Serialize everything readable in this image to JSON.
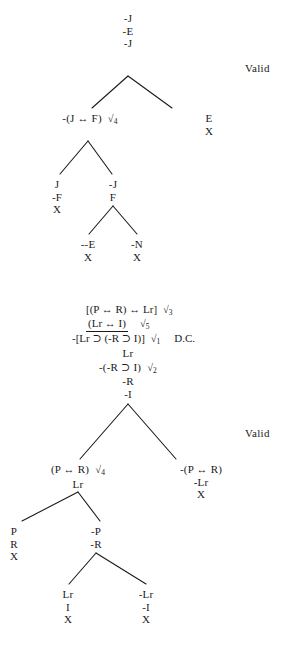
{
  "document": {
    "type": "logic-truth-tree-proofs",
    "verdicts": [
      {
        "label": "Valid",
        "x": 245,
        "y": 62
      },
      {
        "label": "Valid",
        "x": 245,
        "y": 427
      }
    ]
  },
  "proof_one": {
    "trunk": {
      "lines": [
        "-J",
        "-E",
        "-J"
      ],
      "x": 128,
      "y": 12
    },
    "left_branch": {
      "lines": [
        "-(J ↔ F)",
        "√4"
      ],
      "text": "-(J ↔ F)",
      "check": "√",
      "check_sub": "4",
      "x": 90,
      "y": 112
    },
    "right_branch": {
      "lines": [
        "E",
        "X"
      ],
      "x": 209,
      "y": 112
    },
    "left_left": {
      "lines": [
        "J",
        "-F",
        "X"
      ],
      "x": 57,
      "y": 178
    },
    "left_right": {
      "lines": [
        "-J",
        "F"
      ],
      "x": 113,
      "y": 178
    },
    "leaf_a": {
      "lines": [
        "--E",
        "X"
      ],
      "x": 88,
      "y": 238
    },
    "leaf_b": {
      "lines": [
        "-N",
        "X"
      ],
      "x": 137,
      "y": 238
    }
  },
  "proof_two": {
    "premises": [
      {
        "text": "[(P ↔ R) ↔ Lr]",
        "check": "√",
        "check_sub": "3",
        "underline": false,
        "note": ""
      },
      {
        "text": "(Lr ↔ I)",
        "check": "√",
        "check_sub": "5",
        "underline": true,
        "note": ""
      },
      {
        "text": "-[Lr ⊃ (-R ⊃ I)]",
        "check": "√",
        "check_sub": "1",
        "underline": false,
        "note": "D.C."
      }
    ],
    "trunk": {
      "lines": [
        "Lr"
      ],
      "x": 128,
      "y": 349
    },
    "decomposed": {
      "text": "-(-R ⊃ I)",
      "check": "√",
      "check_sub": "2",
      "x": 128,
      "y": 362
    },
    "trunk_tail": {
      "lines": [
        "-R",
        "-I"
      ],
      "x": 128,
      "y": 376
    },
    "left_branch": {
      "text": "(P ↔ R)",
      "check": "√",
      "check_sub": "4",
      "sub_line": "Lr",
      "x": 78,
      "y": 463
    },
    "right_branch": {
      "lines": [
        "-(P ↔ R)",
        "-Lr",
        "X"
      ],
      "x": 201,
      "y": 463
    },
    "left_left": {
      "lines": [
        "P",
        "R",
        "X"
      ],
      "x": 14,
      "y": 525
    },
    "left_right": {
      "lines": [
        "-P",
        "-R"
      ],
      "x": 96,
      "y": 525
    },
    "leaf_a": {
      "lines": [
        "Lr",
        "I",
        "X"
      ],
      "x": 68,
      "y": 588
    },
    "leaf_b": {
      "lines": [
        "-Lr",
        "-I",
        "X"
      ],
      "x": 146,
      "y": 588
    }
  },
  "connectors": {
    "proof_one": [
      {
        "name": "root-split-left",
        "x1": 128,
        "y1": 76,
        "x2": 92,
        "y2": 108
      },
      {
        "name": "root-split-right",
        "x1": 128,
        "y1": 76,
        "x2": 172,
        "y2": 108
      },
      {
        "name": "left-split-left",
        "x1": 88,
        "y1": 141,
        "x2": 60,
        "y2": 174
      },
      {
        "name": "left-split-right",
        "x1": 88,
        "y1": 141,
        "x2": 112,
        "y2": 174
      },
      {
        "name": "f-split-left",
        "x1": 113,
        "y1": 206,
        "x2": 89,
        "y2": 234
      },
      {
        "name": "f-split-right",
        "x1": 113,
        "y1": 206,
        "x2": 137,
        "y2": 234
      }
    ],
    "proof_two": [
      {
        "name": "root-split-left",
        "x1": 128,
        "y1": 404,
        "x2": 80,
        "y2": 459
      },
      {
        "name": "root-split-right",
        "x1": 128,
        "y1": 404,
        "x2": 176,
        "y2": 459
      },
      {
        "name": "left-split-left",
        "x1": 78,
        "y1": 492,
        "x2": 22,
        "y2": 521
      },
      {
        "name": "left-split-right",
        "x1": 78,
        "y1": 492,
        "x2": 100,
        "y2": 521
      },
      {
        "name": "r-split-left",
        "x1": 96,
        "y1": 553,
        "x2": 69,
        "y2": 584
      },
      {
        "name": "r-split-right",
        "x1": 96,
        "y1": 553,
        "x2": 146,
        "y2": 584
      }
    ]
  }
}
